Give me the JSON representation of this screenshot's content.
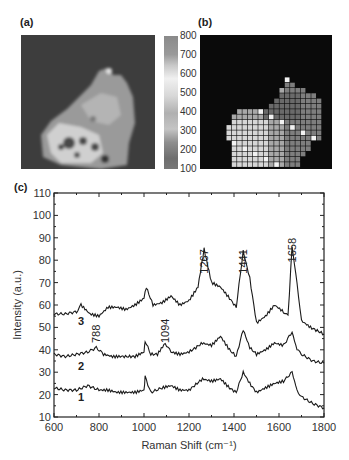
{
  "panels": {
    "a": {
      "label": "(a)"
    },
    "b": {
      "label": "(b)"
    },
    "c": {
      "label": "(c)"
    }
  },
  "colorbar": {
    "ticks": [
      "800",
      "700",
      "600",
      "500",
      "400",
      "300",
      "200",
      "100"
    ],
    "min": 100,
    "max": 800
  },
  "chart_data": {
    "type": "line",
    "title": "",
    "xlabel": "Raman Shift (cm⁻¹)",
    "ylabel": "Intensity (a.u.)",
    "xlim": [
      600,
      1800
    ],
    "ylim": [
      10,
      110
    ],
    "xticks": [
      600,
      800,
      1000,
      1200,
      1400,
      1600,
      1800
    ],
    "yticks": [
      10,
      20,
      30,
      40,
      50,
      60,
      70,
      80,
      90,
      100,
      110
    ],
    "grid": false,
    "annotations": [
      {
        "text": "1267",
        "x": 1267,
        "y": 74
      },
      {
        "text": "1441",
        "x": 1441,
        "y": 74
      },
      {
        "text": "1658",
        "x": 1658,
        "y": 79
      },
      {
        "text": "788",
        "x": 788,
        "y": 43
      },
      {
        "text": "1094",
        "x": 1094,
        "y": 43
      }
    ],
    "series": [
      {
        "name": "3",
        "x": [
          600,
          650,
          700,
          720,
          760,
          800,
          840,
          880,
          920,
          960,
          1000,
          1010,
          1040,
          1080,
          1120,
          1160,
          1200,
          1240,
          1267,
          1300,
          1340,
          1380,
          1410,
          1441,
          1470,
          1500,
          1540,
          1580,
          1620,
          1640,
          1658,
          1680,
          1700,
          1740,
          1800
        ],
        "y": [
          56,
          56,
          57,
          60,
          56,
          55,
          59,
          59,
          58,
          60,
          63,
          68,
          60,
          61,
          64,
          60,
          62,
          68,
          85,
          70,
          68,
          63,
          59,
          84,
          72,
          52,
          55,
          60,
          57,
          55,
          86,
          70,
          53,
          50,
          47
        ]
      },
      {
        "name": "2",
        "x": [
          600,
          650,
          700,
          750,
          788,
          820,
          860,
          900,
          960,
          1000,
          1005,
          1030,
          1060,
          1094,
          1120,
          1160,
          1200,
          1260,
          1300,
          1340,
          1380,
          1410,
          1441,
          1470,
          1500,
          1540,
          1580,
          1620,
          1658,
          1680,
          1700,
          1750,
          1800
        ],
        "y": [
          38,
          37,
          38,
          39,
          41,
          38,
          37,
          37,
          37,
          39,
          44,
          38,
          38,
          43,
          39,
          38,
          39,
          43,
          42,
          46,
          40,
          37,
          49,
          41,
          38,
          40,
          43,
          42,
          48,
          40,
          38,
          35,
          34
        ]
      },
      {
        "name": "1",
        "x": [
          600,
          650,
          700,
          750,
          800,
          840,
          880,
          920,
          960,
          1000,
          1005,
          1030,
          1080,
          1120,
          1160,
          1200,
          1260,
          1300,
          1340,
          1380,
          1410,
          1441,
          1470,
          1500,
          1540,
          1580,
          1620,
          1658,
          1680,
          1700,
          1750,
          1800
        ],
        "y": [
          23,
          22,
          22,
          24,
          22,
          22,
          21,
          21,
          21,
          22,
          28,
          21,
          23,
          24,
          22,
          22,
          27,
          26,
          27,
          23,
          21,
          30,
          25,
          21,
          23,
          25,
          26,
          30,
          22,
          19,
          16,
          14
        ]
      }
    ],
    "series_labels": [
      {
        "text": "3",
        "x": 720,
        "y": 51
      },
      {
        "text": "2",
        "x": 720,
        "y": 31
      },
      {
        "text": "1",
        "x": 720,
        "y": 17
      }
    ]
  }
}
